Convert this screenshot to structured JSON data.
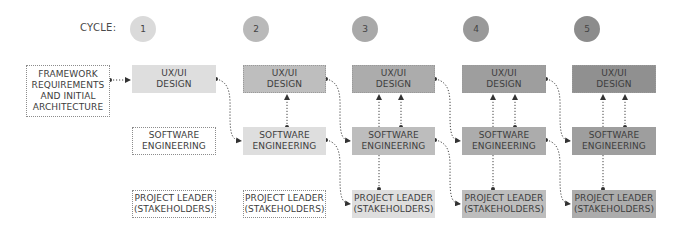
{
  "cycle_label": "CYCLE:",
  "cycles": [
    {
      "number": "1",
      "color": "#dadada"
    },
    {
      "number": "2",
      "color": "#b9b9b9"
    },
    {
      "number": "3",
      "color": "#a9a9a9"
    },
    {
      "number": "4",
      "color": "#999999"
    },
    {
      "number": "5",
      "color": "#8c8c8c"
    }
  ],
  "framework_box": {
    "line1": "FRAMEWORK",
    "line2": "REQUIREMENTS",
    "line3": "AND INITIAL",
    "line4": "ARCHITECTURE"
  },
  "columns": [
    {
      "ux": {
        "line1": "UX/UI",
        "line2": "DESIGN",
        "color": "#dedede"
      },
      "sw": {
        "line1": "SOFTWARE",
        "line2": "ENGINEERING",
        "color": "#ffffff"
      },
      "pl": {
        "line1": "PROJECT LEADER",
        "line2": "(STAKEHOLDERS)",
        "color": "#ffffff"
      }
    },
    {
      "ux": {
        "line1": "UX/UI",
        "line2": "DESIGN",
        "color": "#bebebe"
      },
      "sw": {
        "line1": "SOFTWARE",
        "line2": "ENGINEERING",
        "color": "#dedede"
      },
      "pl": {
        "line1": "PROJECT LEADER",
        "line2": "(STAKEHOLDERS)",
        "color": "#ffffff"
      }
    },
    {
      "ux": {
        "line1": "UX/UI",
        "line2": "DESIGN",
        "color": "#acacac"
      },
      "sw": {
        "line1": "SOFTWARE",
        "line2": "ENGINEERING",
        "color": "#bdbdbd"
      },
      "pl": {
        "line1": "PROJECT LEADER",
        "line2": "(STAKEHOLDERS)",
        "color": "#dedede"
      }
    },
    {
      "ux": {
        "line1": "UX/UI",
        "line2": "DESIGN",
        "color": "#9e9e9e"
      },
      "sw": {
        "line1": "SOFTWARE",
        "line2": "ENGINEERING",
        "color": "#acacac"
      },
      "pl": {
        "line1": "PROJECT LEADER",
        "line2": "(STAKEHOLDERS)",
        "color": "#bdbdbd"
      }
    },
    {
      "ux": {
        "line1": "UX/UI",
        "line2": "DESIGN",
        "color": "#909090"
      },
      "sw": {
        "line1": "SOFTWARE",
        "line2": "ENGINEERING",
        "color": "#9e9e9e"
      },
      "pl": {
        "line1": "PROJECT LEADER",
        "line2": "(STAKEHOLDERS)",
        "color": "#acacac"
      }
    }
  ]
}
